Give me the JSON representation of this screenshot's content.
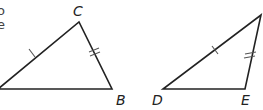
{
  "figure": {
    "cropped_text_fragments": [
      "o",
      "e",
      "l"
    ],
    "stroke_color": "#222222",
    "tick_color": "#555555",
    "background": "#ffffff"
  },
  "triangle_1": {
    "vertices": {
      "left": {
        "label": "",
        "x": 0,
        "y": 89
      },
      "C": {
        "label": "C",
        "x": 79,
        "y": 22
      },
      "B": {
        "label": "B",
        "x": 112,
        "y": 89
      }
    },
    "labels": {
      "C": "C",
      "B": "B"
    },
    "marks": [
      {
        "side": "left-C",
        "ticks": 1
      },
      {
        "side": "C-B",
        "ticks": 2
      }
    ]
  },
  "triangle_2": {
    "vertices": {
      "D": {
        "label": "D",
        "x": 163,
        "y": 89
      },
      "E": {
        "label": "E",
        "x": 245,
        "y": 89
      },
      "top": {
        "label": "",
        "x": 261,
        "y": 15
      }
    },
    "labels": {
      "D": "D",
      "E": "E"
    },
    "marks": [
      {
        "side": "D-top",
        "ticks": 1
      },
      {
        "side": "E-top",
        "ticks": 2
      }
    ]
  }
}
